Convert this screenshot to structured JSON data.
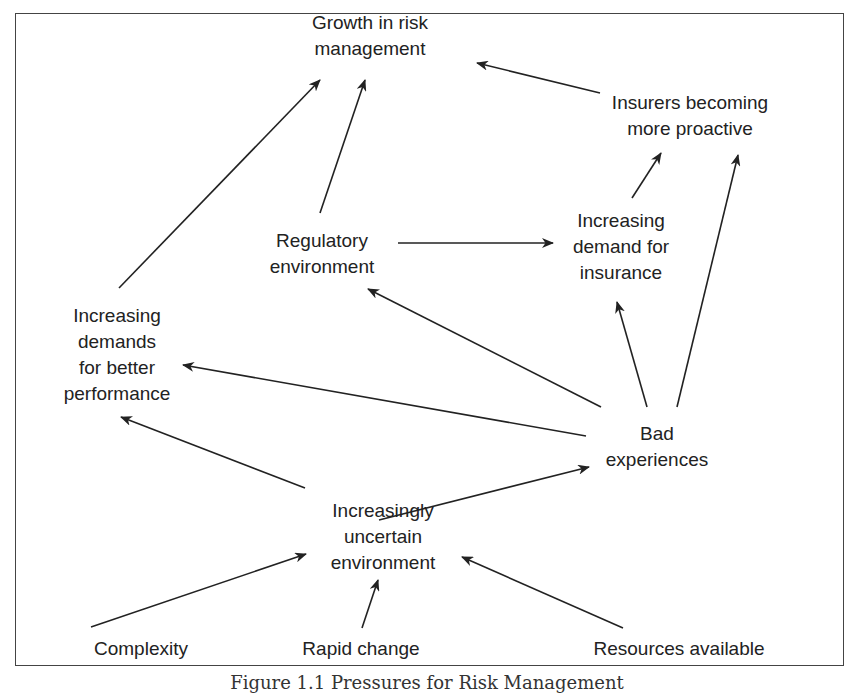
{
  "diagram": {
    "nodes": {
      "growth": {
        "lines": [
          "Growth in risk",
          "management"
        ]
      },
      "insurers": {
        "lines": [
          "Insurers becoming",
          "more proactive"
        ]
      },
      "regulatory": {
        "lines": [
          "Regulatory",
          "environment"
        ]
      },
      "demand_insurance": {
        "lines": [
          "Increasing",
          "demand for",
          "insurance"
        ]
      },
      "performance": {
        "lines": [
          "Increasing",
          "demands",
          "for better",
          "performance"
        ]
      },
      "bad_experiences": {
        "lines": [
          "Bad",
          "experiences"
        ]
      },
      "uncertain": {
        "lines": [
          "Increasingly",
          "uncertain",
          "environment"
        ]
      },
      "complexity": {
        "lines": [
          "Complexity"
        ]
      },
      "rapid_change": {
        "lines": [
          "Rapid change"
        ]
      },
      "resources": {
        "lines": [
          "Resources available"
        ]
      }
    },
    "edges": [
      {
        "from": "performance",
        "to": "growth"
      },
      {
        "from": "regulatory",
        "to": "growth"
      },
      {
        "from": "insurers",
        "to": "growth"
      },
      {
        "from": "regulatory",
        "to": "demand_insurance"
      },
      {
        "from": "demand_insurance",
        "to": "insurers"
      },
      {
        "from": "bad_experiences",
        "to": "demand_insurance"
      },
      {
        "from": "bad_experiences",
        "to": "insurers"
      },
      {
        "from": "bad_experiences",
        "to": "regulatory"
      },
      {
        "from": "bad_experiences",
        "to": "performance"
      },
      {
        "from": "uncertain",
        "to": "performance"
      },
      {
        "from": "uncertain",
        "to": "bad_experiences"
      },
      {
        "from": "complexity",
        "to": "uncertain"
      },
      {
        "from": "rapid_change",
        "to": "uncertain"
      },
      {
        "from": "resources",
        "to": "uncertain"
      }
    ],
    "caption": "Figure 1.1 Pressures for Risk Management"
  }
}
